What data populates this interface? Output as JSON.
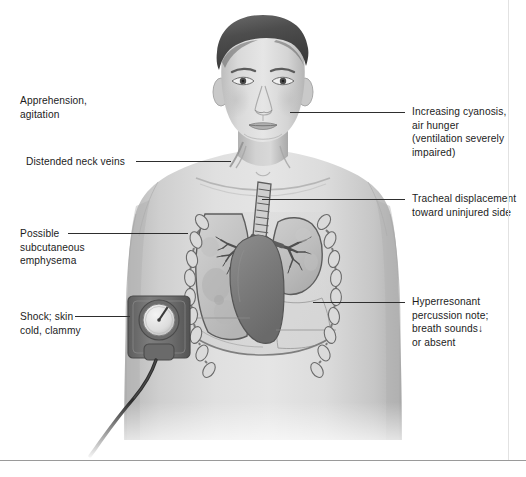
{
  "labels": {
    "apprehension": {
      "text": "Apprehension,\nagitation",
      "side": "left"
    },
    "distended_neck_veins": {
      "text": "Distended neck veins",
      "side": "left"
    },
    "subcutaneous_emphysema": {
      "text": "Possible\nsubcutaneous\nemphysema",
      "side": "left"
    },
    "shock": {
      "text": "Shock; skin\ncold, clammy",
      "side": "left"
    },
    "cyanosis": {
      "text": "Increasing cyanosis,\nair hunger\n(ventilation severely\nimpaired)",
      "side": "right"
    },
    "tracheal_displacement": {
      "text": "Tracheal displacement\ntoward uninjured side",
      "side": "right"
    },
    "hyperresonance": {
      "text": "Hyperresonant\npercussion note;\nbreath sounds↓\nor absent",
      "side": "right"
    }
  },
  "anatomy": {
    "trachea": "trachea",
    "right_lung": "right lung (intact)",
    "left_lung": "left lung (collapsed)",
    "heart": "heart",
    "ribs": "rib cage",
    "bp_cuff": "blood pressure cuff",
    "bp_gauge": "sphygmomanometer gauge"
  },
  "colors": {
    "text": "#1c1c1c",
    "leader_line": "#2e2e2e",
    "rule": "#9a9a9a",
    "skin_light": "#dcdcdc",
    "skin_mid": "#c4c4c4",
    "skin_shadow": "#a9a9a9",
    "hair": "#4a4a4a",
    "lung_fill": "#c9c9c9",
    "lung_outline": "#5d5d5d",
    "heart": "#7c7c7c",
    "rib": "#8f8f8f",
    "cuff": "#6e6e6e",
    "background": "#ffffff"
  }
}
